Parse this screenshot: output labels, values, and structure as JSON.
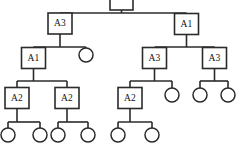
{
  "diagram": {
    "type": "tree",
    "title": "",
    "node_shapes": {
      "labeled": "square",
      "leaf": "circle"
    },
    "colors": {
      "stroke": "#2b2b2b",
      "fill": "#ffffff",
      "text": "#111111"
    },
    "nodes": [
      {
        "id": "root",
        "label": "",
        "shape": "square",
        "x": 121.5,
        "y": 0,
        "w": 23,
        "h": 20,
        "clipped_top": true
      },
      {
        "id": "n-a3-l",
        "label": "A3",
        "shape": "square",
        "x": 60,
        "y": 23.5,
        "w": 24,
        "h": 21
      },
      {
        "id": "n-a1-r",
        "label": "A1",
        "shape": "square",
        "x": 186.5,
        "y": 24,
        "w": 24,
        "h": 21
      },
      {
        "id": "n-a1-l",
        "label": "A1",
        "shape": "square",
        "x": 33.5,
        "y": 58,
        "w": 24,
        "h": 21
      },
      {
        "id": "c-1",
        "label": "",
        "shape": "circle",
        "x": 86,
        "y": 55,
        "r": 7
      },
      {
        "id": "n-a3-m",
        "label": "A3",
        "shape": "square",
        "x": 154.5,
        "y": 58,
        "w": 24,
        "h": 21
      },
      {
        "id": "n-a3-r",
        "label": "A3",
        "shape": "square",
        "x": 214.5,
        "y": 58,
        "w": 24,
        "h": 21
      },
      {
        "id": "n-a2-1",
        "label": "A2",
        "shape": "square",
        "x": 17,
        "y": 98,
        "w": 24,
        "h": 21
      },
      {
        "id": "n-a2-2",
        "label": "A2",
        "shape": "square",
        "x": 67,
        "y": 98,
        "w": 24,
        "h": 21
      },
      {
        "id": "n-a2-3",
        "label": "A2",
        "shape": "square",
        "x": 130,
        "y": 98,
        "w": 24,
        "h": 21
      },
      {
        "id": "c-2",
        "label": "",
        "shape": "circle",
        "x": 172,
        "y": 95,
        "r": 7
      },
      {
        "id": "c-3",
        "label": "",
        "shape": "circle",
        "x": 200,
        "y": 95,
        "r": 7
      },
      {
        "id": "c-4",
        "label": "",
        "shape": "circle",
        "x": 228,
        "y": 95,
        "r": 7
      },
      {
        "id": "c-5",
        "label": "",
        "shape": "circle",
        "x": 8,
        "y": 135,
        "r": 7
      },
      {
        "id": "c-6",
        "label": "",
        "shape": "circle",
        "x": 40,
        "y": 135,
        "r": 7
      },
      {
        "id": "c-7",
        "label": "",
        "shape": "circle",
        "x": 58,
        "y": 135,
        "r": 7
      },
      {
        "id": "c-8",
        "label": "",
        "shape": "circle",
        "x": 88,
        "y": 135,
        "r": 7
      },
      {
        "id": "c-9",
        "label": "",
        "shape": "circle",
        "x": 118,
        "y": 135,
        "r": 7
      },
      {
        "id": "c-10",
        "label": "",
        "shape": "circle",
        "x": 152,
        "y": 135,
        "r": 7
      }
    ],
    "edges": [
      {
        "from": "root",
        "to": "n-a3-l",
        "bus_y": 13
      },
      {
        "from": "root",
        "to": "n-a1-r",
        "bus_y": 13
      },
      {
        "from": "n-a3-l",
        "to": "n-a1-l",
        "bus_y": 47
      },
      {
        "from": "n-a3-l",
        "to": "c-1",
        "bus_y": 47
      },
      {
        "from": "n-a1-r",
        "to": "n-a3-m",
        "bus_y": 47
      },
      {
        "from": "n-a1-r",
        "to": "n-a3-r",
        "bus_y": 47
      },
      {
        "from": "n-a1-l",
        "to": "n-a2-1",
        "bus_y": 81
      },
      {
        "from": "n-a1-l",
        "to": "n-a2-2",
        "bus_y": 81
      },
      {
        "from": "n-a3-m",
        "to": "n-a2-3",
        "bus_y": 81
      },
      {
        "from": "n-a3-m",
        "to": "c-2",
        "bus_y": 81
      },
      {
        "from": "n-a3-r",
        "to": "c-3",
        "bus_y": 81
      },
      {
        "from": "n-a3-r",
        "to": "c-4",
        "bus_y": 81
      },
      {
        "from": "n-a2-1",
        "to": "c-5",
        "bus_y": 122
      },
      {
        "from": "n-a2-1",
        "to": "c-6",
        "bus_y": 122
      },
      {
        "from": "n-a2-2",
        "to": "c-7",
        "bus_y": 122
      },
      {
        "from": "n-a2-2",
        "to": "c-8",
        "bus_y": 122
      },
      {
        "from": "n-a2-3",
        "to": "c-9",
        "bus_y": 122
      },
      {
        "from": "n-a2-3",
        "to": "c-10",
        "bus_y": 122
      }
    ]
  }
}
